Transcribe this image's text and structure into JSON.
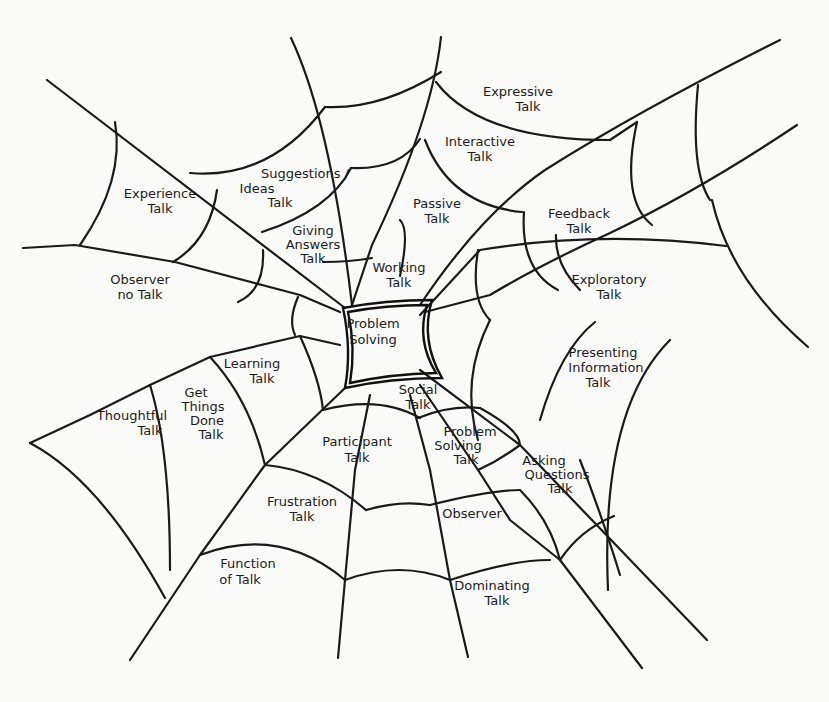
{
  "diagram": {
    "type": "spider-web concept map",
    "colors": {
      "ink": "#1a1a1a",
      "paper": "#fafaf9"
    },
    "center": {
      "lines": [
        "Problem",
        "Solving"
      ]
    },
    "regions": [
      {
        "id": "expressive",
        "lines": [
          "Expressive",
          "Talk"
        ]
      },
      {
        "id": "interactive",
        "lines": [
          "Interactive",
          "Talk"
        ]
      },
      {
        "id": "suggestions",
        "lines": [
          "Suggestions /",
          "Ideas",
          "Talk"
        ]
      },
      {
        "id": "experience",
        "lines": [
          "Experience",
          "Talk"
        ]
      },
      {
        "id": "passive",
        "lines": [
          "Passive",
          "Talk"
        ]
      },
      {
        "id": "giving-answers",
        "lines": [
          "Giving",
          "Answers",
          "Talk"
        ]
      },
      {
        "id": "feedback",
        "lines": [
          "Feedback",
          "Talk"
        ]
      },
      {
        "id": "working",
        "lines": [
          "Working",
          "Talk"
        ]
      },
      {
        "id": "observer-no",
        "lines": [
          "Observer",
          "no Talk"
        ]
      },
      {
        "id": "exploratory",
        "lines": [
          "Exploratory",
          "Talk"
        ]
      },
      {
        "id": "presenting",
        "lines": [
          "Presenting",
          "Information",
          "Talk"
        ]
      },
      {
        "id": "learning",
        "lines": [
          "Learning",
          "Talk"
        ]
      },
      {
        "id": "social",
        "lines": [
          "Social",
          "Talk"
        ]
      },
      {
        "id": "get-things-done",
        "lines": [
          "Get",
          "Things",
          "Done",
          "Talk"
        ]
      },
      {
        "id": "thoughtful",
        "lines": [
          "Thoughtful",
          "Talk"
        ]
      },
      {
        "id": "problem-solving",
        "lines": [
          "Problem",
          "Solving",
          "Talk"
        ]
      },
      {
        "id": "participant",
        "lines": [
          "Participant",
          "Talk"
        ]
      },
      {
        "id": "asking",
        "lines": [
          "Asking",
          "Questions",
          "Talk"
        ]
      },
      {
        "id": "frustration",
        "lines": [
          "Frustration",
          "Talk"
        ]
      },
      {
        "id": "observer",
        "lines": [
          "Observer"
        ]
      },
      {
        "id": "function",
        "lines": [
          "Function",
          "of Talk"
        ]
      },
      {
        "id": "dominating",
        "lines": [
          "Dominating",
          "Talk"
        ]
      }
    ]
  }
}
